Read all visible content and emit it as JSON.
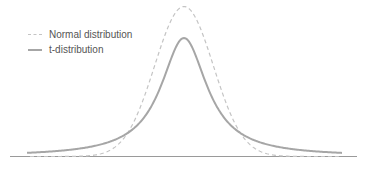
{
  "chart_data": {
    "type": "line",
    "title": "",
    "xlabel": "",
    "ylabel": "",
    "grid": false,
    "axes_visible": {
      "x_baseline": true,
      "ticks": false
    },
    "legend_position": "upper-left",
    "series": [
      {
        "name": "Normal distribution",
        "style": "dashed",
        "color": "#c4c4c4",
        "peak_relative": 1.0,
        "shape": "gaussian",
        "sigma": 1.0
      },
      {
        "name": "t-distribution",
        "style": "solid",
        "color": "#a6a6a6",
        "peak_relative": 0.79,
        "shape": "student-t (heavy tails)",
        "df": 1
      }
    ],
    "x_range": [
      -5.4,
      5.4
    ]
  },
  "legend": {
    "items": [
      {
        "label": "Normal distribution"
      },
      {
        "label": "t-distribution"
      }
    ]
  },
  "colors": {
    "normal": "#c4c4c4",
    "t": "#a6a6a6",
    "baseline": "#999999"
  }
}
